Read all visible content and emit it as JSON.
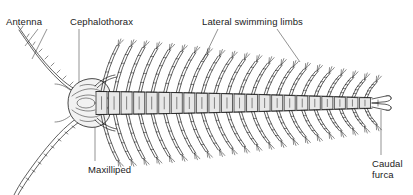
{
  "figure": {
    "kind": "scientific-illustration",
    "background_color": "#ffffff",
    "ink_color": "#1a1a1a",
    "segment_fill": "#e8e8e8",
    "width": 413,
    "height": 195
  },
  "labels": {
    "antenna": "Antenna",
    "cephalothorax": "Cephalothorax",
    "lateral_swimming_limbs": "Lateral swimming limbs",
    "maxilliped": "Maxilliped",
    "caudal_furca_line1": "Caudal",
    "caudal_furca_line2": "furca"
  },
  "anatomy": {
    "body_segments": 22,
    "limb_pairs": 22,
    "antennae": 2,
    "caudal_furca_rami": 2,
    "body_axis_y": 103,
    "body_start_x": 96,
    "body_end_x": 372
  }
}
